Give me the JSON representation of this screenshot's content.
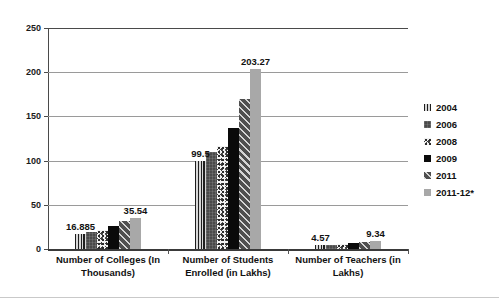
{
  "caption_sliver": "",
  "chart_data": {
    "type": "bar",
    "title": "",
    "xlabel": "",
    "ylabel": "",
    "ylim": [
      0,
      250
    ],
    "yticks": [
      0,
      50,
      100,
      150,
      200,
      250
    ],
    "grid": true,
    "legend_position": "right",
    "categories": [
      "Number of Colleges (In Thousands)",
      "Number of Students Enrolled  (in Lakhs)",
      "Number of Teachers  (in Lakhs)"
    ],
    "series": [
      {
        "name": "2004",
        "pattern": "vertical-stripes",
        "values": [
          16.885,
          99.5,
          4.57
        ]
      },
      {
        "name": "2006",
        "pattern": "dark-grid",
        "values": [
          19.5,
          110.0,
          5.0
        ]
      },
      {
        "name": "2008",
        "pattern": "speckled",
        "values": [
          22.0,
          116.1,
          5.5
        ]
      },
      {
        "name": "2009",
        "pattern": "solid-black",
        "values": [
          26.0,
          136.4,
          6.99
        ]
      },
      {
        "name": "2011",
        "pattern": "diagonal-stripes",
        "values": [
          32.0,
          169.8,
          8.17
        ]
      },
      {
        "name": "2011-12*",
        "pattern": "solid-gray",
        "values": [
          35.54,
          203.27,
          9.34
        ]
      }
    ],
    "annotations": [
      {
        "group": 0,
        "series": "2004",
        "text": "16.885"
      },
      {
        "group": 0,
        "series": "2011-12*",
        "text": "35.54"
      },
      {
        "group": 1,
        "series": "2004",
        "text": "99.5"
      },
      {
        "group": 1,
        "series": "2011-12*",
        "text": "203.27"
      },
      {
        "group": 2,
        "series": "2004",
        "text": "4.57"
      },
      {
        "group": 2,
        "series": "2011-12*",
        "text": "9.34"
      }
    ]
  },
  "legend": {
    "items": [
      {
        "label": "2004"
      },
      {
        "label": "2006"
      },
      {
        "label": "2008"
      },
      {
        "label": "2009"
      },
      {
        "label": "2011"
      },
      {
        "label": "2011-12*"
      }
    ]
  },
  "colors": {
    "axis": "#4a4a4a",
    "grid": "#9a9a9a",
    "text": "#111111",
    "series_2009": "#0a0a0a",
    "series_201112": "#a8a8a8"
  }
}
